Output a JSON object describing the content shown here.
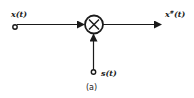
{
  "diagram": {
    "type": "signal-flow block diagram",
    "caption": "(a)",
    "nodes": [
      {
        "id": "input",
        "label": "x(t)",
        "kind": "input-terminal"
      },
      {
        "id": "mult",
        "label": "×",
        "kind": "multiplier"
      },
      {
        "id": "carrier",
        "label": "s(t)",
        "kind": "input-terminal"
      },
      {
        "id": "output",
        "label_base": "x",
        "label_sup": "#",
        "label_arg": "(t)",
        "kind": "output"
      }
    ],
    "edges": [
      {
        "from": "input",
        "to": "mult"
      },
      {
        "from": "carrier",
        "to": "mult"
      },
      {
        "from": "mult",
        "to": "output"
      }
    ],
    "colors": {
      "stroke": "#1a1a1a",
      "background": "#ffffff"
    }
  }
}
